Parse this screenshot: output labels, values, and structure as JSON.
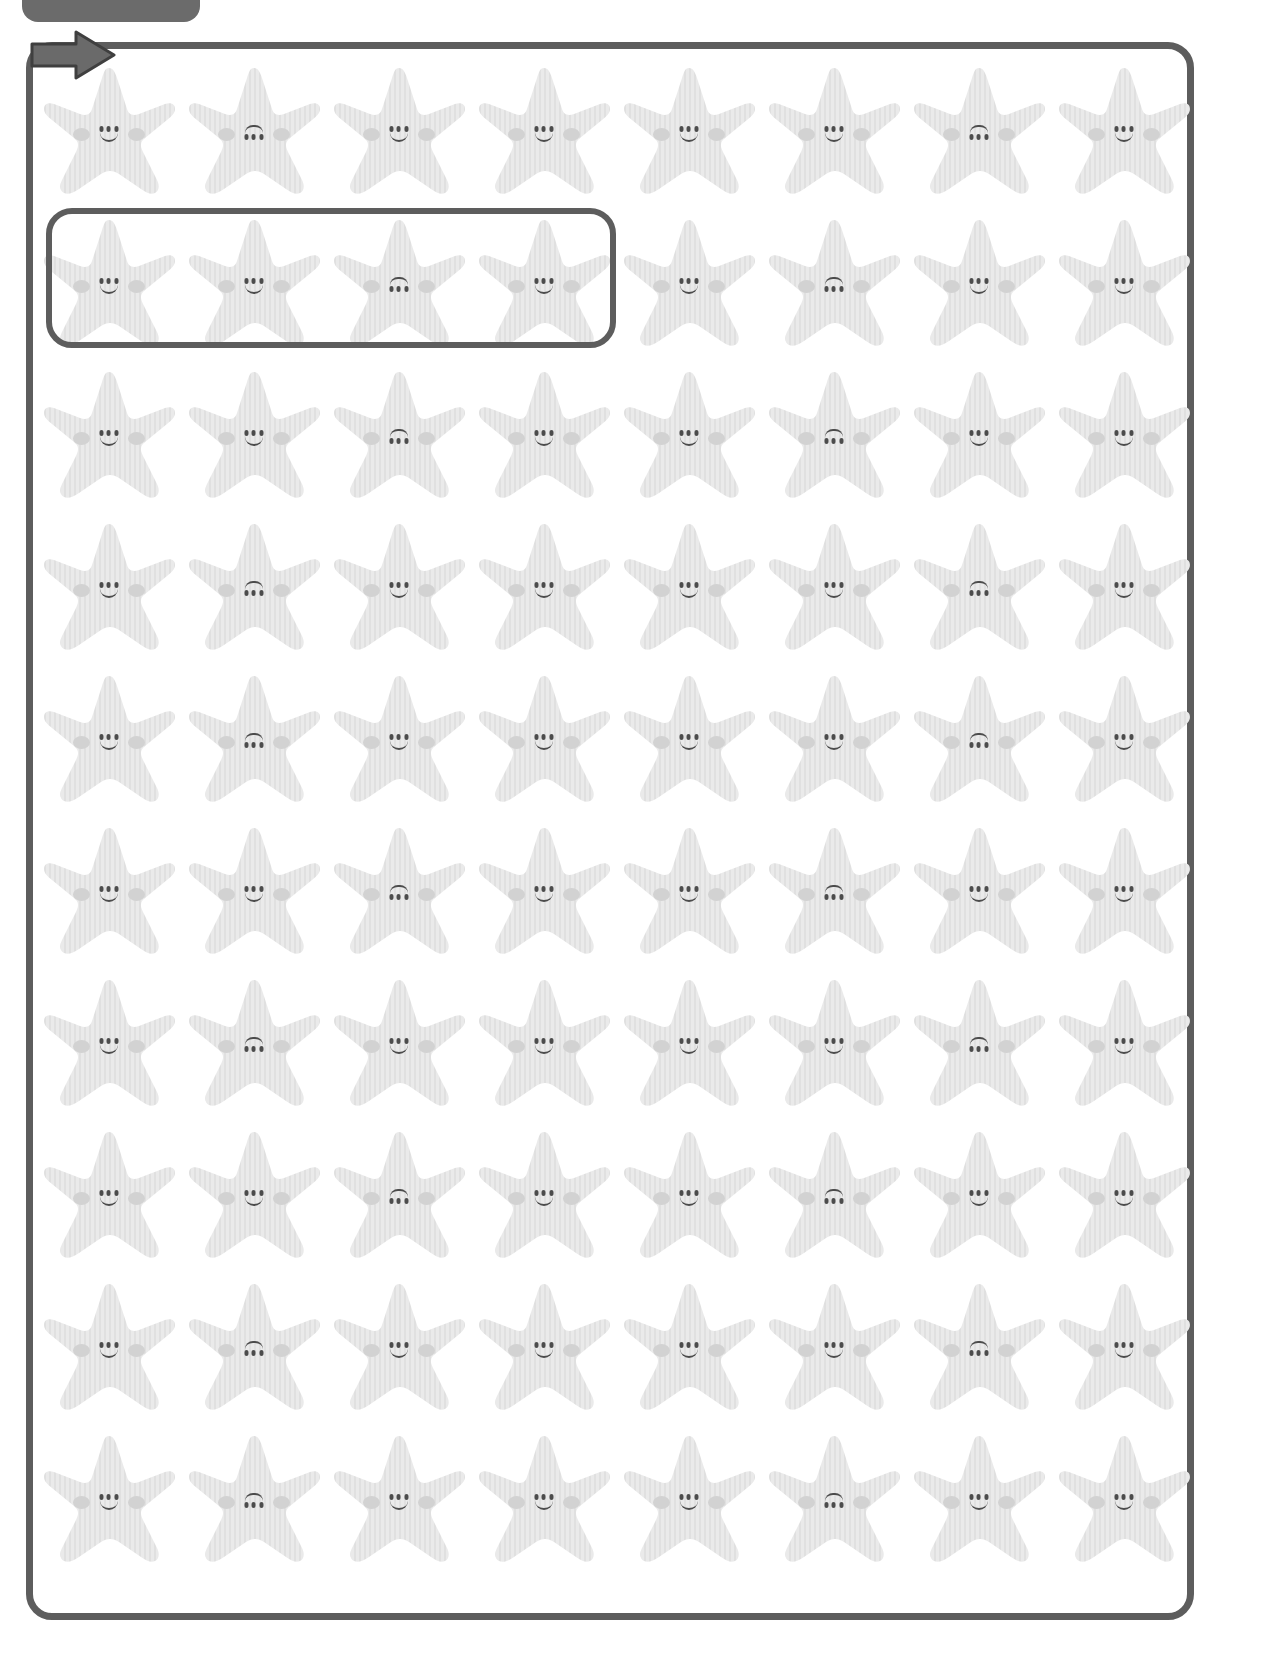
{
  "page": {
    "width": 1284,
    "height": 1656,
    "background_color": "#ffffff"
  },
  "top_tab": {
    "label": "",
    "color": "#6b6b6b",
    "note": "partially cut off rounded tab at top edge"
  },
  "entry_arrow": {
    "icon": "arrow-right-icon",
    "color": "#5d5d5d",
    "direction": "right"
  },
  "frame": {
    "border_color": "#5d5d5d",
    "border_width": 7,
    "corner_radius": 26
  },
  "selection_box": {
    "border_color": "#5d5d5d",
    "border_width": 6,
    "covers_row": 2,
    "covers_columns": [
      1,
      2,
      3,
      4
    ]
  },
  "style": {
    "star_fill": "#eaeaea",
    "star_stripe": "#e0e0e0",
    "cheek_color": "#d2d2d2",
    "face_color": "#4c4c4c"
  },
  "grid": {
    "rows": 10,
    "columns": 8,
    "item_name": "starfish",
    "face_variants": [
      "smile",
      "upside"
    ],
    "faces": [
      [
        "smile",
        "upside",
        "smile",
        "smile",
        "smile",
        "smile",
        "upside",
        "smile"
      ],
      [
        "smile",
        "smile",
        "upside",
        "smile",
        "smile",
        "upside",
        "smile",
        "smile"
      ],
      [
        "smile",
        "smile",
        "upside",
        "smile",
        "smile",
        "upside",
        "smile",
        "smile"
      ],
      [
        "smile",
        "upside",
        "smile",
        "smile",
        "smile",
        "smile",
        "upside",
        "smile"
      ],
      [
        "smile",
        "upside",
        "smile",
        "smile",
        "smile",
        "smile",
        "upside",
        "smile"
      ],
      [
        "smile",
        "smile",
        "upside",
        "smile",
        "smile",
        "upside",
        "smile",
        "smile"
      ],
      [
        "smile",
        "upside",
        "smile",
        "smile",
        "smile",
        "smile",
        "upside",
        "smile"
      ],
      [
        "smile",
        "smile",
        "upside",
        "smile",
        "smile",
        "upside",
        "smile",
        "smile"
      ],
      [
        "smile",
        "upside",
        "smile",
        "smile",
        "smile",
        "smile",
        "upside",
        "smile"
      ],
      [
        "smile",
        "upside",
        "smile",
        "smile",
        "smile",
        "upside",
        "smile",
        "smile"
      ]
    ]
  }
}
